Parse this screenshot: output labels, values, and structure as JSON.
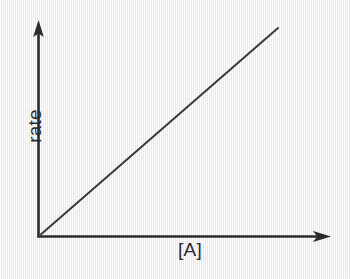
{
  "chart_data": {
    "type": "line",
    "title": "",
    "subtitle": "",
    "xlabel": "[A]",
    "ylabel": "rate",
    "grid": false,
    "legend": null,
    "axis_style": "arrowed-half-axes",
    "tick_labels_x": [],
    "tick_labels_y": [],
    "xlim": [
      0,
      1
    ],
    "ylim": [
      0,
      1
    ],
    "annotations": [],
    "series": [
      {
        "name": "first-order rate law",
        "description": "straight line through the origin with positive slope",
        "x": [
          0,
          1
        ],
        "y": [
          0,
          1
        ],
        "slope": 1,
        "intercept": 0,
        "color": "#3a3a3a",
        "line_width_px": 2
      }
    ]
  },
  "figure": {
    "background_color": "#ececec",
    "ink_color": "#2b2b2b"
  },
  "axes": {
    "x_axis_name": "x-axis",
    "y_axis_name": "y-axis",
    "origin_label": ""
  }
}
